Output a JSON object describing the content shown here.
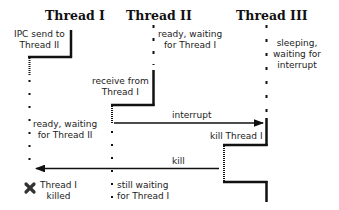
{
  "threads": [
    {
      "title": "Thread I"
    },
    {
      "title": "Thread II"
    },
    {
      "title": "Thread III"
    }
  ],
  "labels": {
    "ipc_send": [
      "IPC send to",
      "Thread II"
    ],
    "ready_waiting_t1": [
      "ready, waiting",
      "for Thread I"
    ],
    "sleeping": [
      "sleeping,",
      "waiting for",
      "interrupt"
    ],
    "receive": [
      "receive from",
      "Thread I"
    ],
    "interrupt": "interrupt",
    "ready_waiting_t2": [
      "ready, waiting",
      "for Thread II"
    ],
    "kill_thread": "kill Thread I",
    "kill": "kill",
    "killed": [
      "Thread I",
      "killed"
    ],
    "still_waiting": [
      "still waiting",
      "for Thread I"
    ]
  },
  "icons": {
    "killed_marker": "cross-icon"
  },
  "colors": {
    "line": "#111111",
    "text": "#222222",
    "background": "#ffffff"
  }
}
